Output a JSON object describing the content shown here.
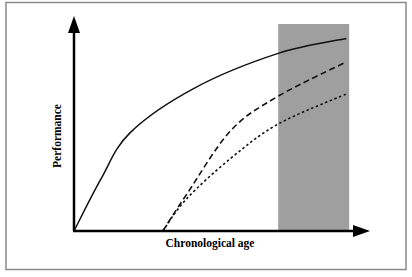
{
  "chart_data": {
    "type": "line",
    "title": "",
    "xlabel": "Chronological age",
    "ylabel": "Performance",
    "axis_ticks": "none",
    "grid": false,
    "legend": "none",
    "x_range": [
      0,
      100
    ],
    "y_range": [
      0,
      100
    ],
    "shaded_region": {
      "x_start": 69,
      "x_end": 93,
      "color": "#9f9f9f",
      "description": "shaded vertical band near upper end of age axis"
    },
    "series": [
      {
        "name": "solid-curve",
        "style": "solid",
        "x": [
          0,
          9,
          19,
          41,
          69,
          92
        ],
        "y": [
          0,
          24,
          46,
          67,
          83,
          90
        ]
      },
      {
        "name": "long-dashed-curve",
        "style": "long-dash",
        "x": [
          30,
          38,
          53,
          69,
          92
        ],
        "y": [
          0,
          17,
          47,
          63,
          79
        ]
      },
      {
        "name": "short-dashed-curve",
        "style": "short-dash",
        "x": [
          30,
          38,
          53,
          69,
          92
        ],
        "y": [
          0,
          15,
          34,
          50,
          64
        ]
      }
    ]
  },
  "colors": {
    "axis": "#000000",
    "curve": "#111111",
    "shade": "#9f9f9f",
    "frame": "#8a8a8a",
    "background": "#ffffff"
  }
}
